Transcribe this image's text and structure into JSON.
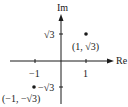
{
  "diagram": {
    "type": "complex-plane",
    "axes": {
      "x_label": "Re",
      "y_label": "Im"
    },
    "ticks": {
      "x_pos": "1",
      "x_neg": "−1",
      "y_pos": "√3",
      "y_neg": "−√3"
    },
    "points": [
      {
        "label": "(1, √3)",
        "x": 1,
        "y": 1.732
      },
      {
        "label": "(−1, −√3)",
        "x": -1,
        "y": -1.732
      }
    ],
    "colors": {
      "ink": "#1a1a1a",
      "background": "#ffffff"
    }
  }
}
